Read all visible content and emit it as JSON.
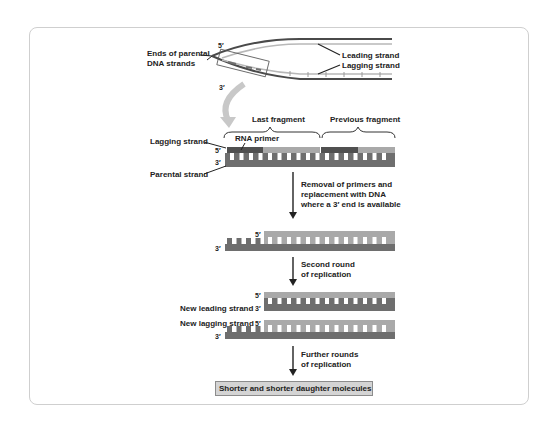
{
  "figure": {
    "fork": {
      "end_label_line1": "Ends of parental",
      "end_label_line2": "DNA strands",
      "five_prime": "5′",
      "three_prime": "3′",
      "leading_label": "Leading strand",
      "lagging_label": "Lagging strand"
    },
    "fragments": {
      "last_fragment": "Last fragment",
      "previous_fragment": "Previous fragment",
      "rna_primer": "RNA primer",
      "lagging_strand": "Lagging strand",
      "parental_strand": "Parental strand",
      "five_prime": "5′",
      "three_prime": "3′"
    },
    "steps": [
      {
        "lines": [
          "Removal of primers and",
          "replacement with DNA",
          "where a 3′ end is available"
        ]
      },
      {
        "lines": [
          "Second round",
          "of replication"
        ]
      },
      {
        "lines": [
          "Further rounds",
          "of replication"
        ]
      }
    ],
    "after_removal": {
      "five_prime": "5′",
      "three_prime": "3′"
    },
    "second_round": {
      "new_leading": "New leading strand",
      "new_lagging": "New lagging strand",
      "five_prime": "5′",
      "three_prime": "3′"
    },
    "result": "Shorter and shorter daughter molecules",
    "colors": {
      "parental": "#6e6e6e",
      "new_dna": "#a9a9a9",
      "rna_primer": "#505050",
      "fork_parent": "#4a4a4a",
      "fork_new": "#b8b8b8",
      "curved_arrow": "#c8c8c8",
      "result_box": "#d4d4d4"
    }
  }
}
